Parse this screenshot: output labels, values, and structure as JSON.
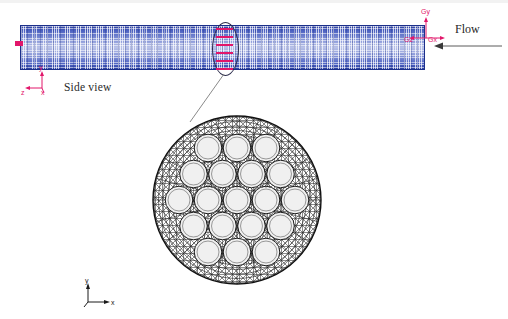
{
  "figure": {
    "background_color": "#ffffff"
  },
  "side_view": {
    "label": "Side view",
    "mesh_color": "#3b50ab",
    "mesh_edge_color": "#1b2f8a",
    "block": {
      "x": 20,
      "y": 25,
      "width": 405,
      "height": 45
    },
    "left_edge_marker_color": "#e2166a"
  },
  "flow": {
    "label": "Flow",
    "direction": "left",
    "arrow_color": "#555555"
  },
  "highlight": {
    "shape": "ellipse",
    "marker_color": "#e2166a",
    "marker_count": 6,
    "leader_line_color": "#777777",
    "description": "cross-section slice location"
  },
  "global_triad": {
    "color": "#e2166a",
    "axes": [
      {
        "name": "Gy",
        "label": "Gy",
        "direction": "up"
      },
      {
        "name": "Gx",
        "label": "Gx",
        "direction": "right"
      },
      {
        "name": "Gz",
        "label": "Gz",
        "direction": "left"
      }
    ]
  },
  "side_triad": {
    "color": "#e2166a",
    "axes": [
      {
        "name": "y",
        "label": "y",
        "direction": "up"
      },
      {
        "name": "x",
        "label": "x",
        "direction": "right"
      },
      {
        "name": "z",
        "label": "z",
        "direction": "left"
      }
    ]
  },
  "bottom_triad": {
    "color": "#1a1a1a",
    "axes": [
      {
        "name": "y",
        "label": "y",
        "direction": "up"
      },
      {
        "name": "x",
        "label": "x",
        "direction": "right"
      }
    ]
  },
  "cross_section": {
    "description": "Circular duct cross-section mesh containing a hexagonal rod bundle",
    "outer_shape": "circle",
    "mesh_color": "#1a1a1a",
    "rod_fill_color": "#f0f0f0",
    "rod_count": 19,
    "rod_rows": [
      3,
      4,
      5,
      4,
      3
    ],
    "center": {
      "cx": 85,
      "cy": 90
    },
    "outer_radius": 84,
    "rod_radius": 13.8,
    "rod_pitch": 29.0
  }
}
